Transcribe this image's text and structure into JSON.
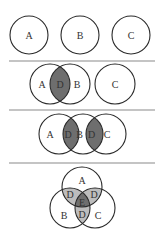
{
  "diagram": {
    "colors": {
      "stroke": "#2a2a2a",
      "divider": "#8a8a8a",
      "dark_fill": "#6e6e6e",
      "light_fill": "#bdbdbd",
      "background": "#ffffff"
    },
    "panels": [
      {
        "id": "panel-1",
        "description": "Three separate circles",
        "labels": {
          "a": "A",
          "b": "B",
          "c": "C"
        }
      },
      {
        "id": "panel-2",
        "description": "A and B overlap with shaded intersection D; C separate",
        "labels": {
          "a": "A",
          "d": "D",
          "b": "B",
          "c": "C"
        }
      },
      {
        "id": "panel-3",
        "description": "A, B, C in a chain; A∩B and B∩C shaded as D",
        "labels": {
          "a": "A",
          "d1": "D",
          "b": "B",
          "d2": "D",
          "c": "C"
        }
      },
      {
        "id": "panel-4",
        "description": "Three-way Venn; pairwise intersections D (light), triple intersection E (dark)",
        "labels": {
          "a": "A",
          "d_ab": "D",
          "d_ac": "D",
          "e": "E",
          "b": "B",
          "d_bc": "D",
          "c": "C"
        }
      }
    ]
  }
}
